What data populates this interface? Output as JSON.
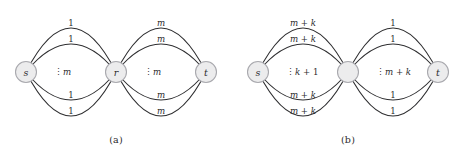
{
  "figure": {
    "kind": "multigraph-diagram",
    "panels": [
      {
        "id": "a",
        "caption": "(a)",
        "nodes": [
          {
            "id": "s",
            "label": "s",
            "cx": 26,
            "cy": 72,
            "r": 10.5
          },
          {
            "id": "r",
            "label": "r",
            "cx": 116,
            "cy": 72,
            "r": 10.5
          },
          {
            "id": "t",
            "label": "t",
            "cx": 206,
            "cy": 72,
            "r": 10.5
          }
        ],
        "bundles": [
          {
            "id": "s-r",
            "from": "s",
            "to": "r",
            "multiplicity_label": "m",
            "dots": "⋮",
            "edges": [
              {
                "label": "1",
                "offset": -44
              },
              {
                "label": "1",
                "offset": -28
              },
              {
                "label": "1",
                "offset": 28
              },
              {
                "label": "1",
                "offset": 44
              }
            ]
          },
          {
            "id": "r-t",
            "from": "r",
            "to": "t",
            "multiplicity_label": "m",
            "dots": "⋮",
            "edges": [
              {
                "label": "m",
                "offset": -44
              },
              {
                "label": "m",
                "offset": -28
              },
              {
                "label": "m",
                "offset": 28
              },
              {
                "label": "m",
                "offset": 44
              }
            ]
          }
        ]
      },
      {
        "id": "b",
        "caption": "(b)",
        "nodes": [
          {
            "id": "s",
            "label": "s",
            "cx": 26,
            "cy": 72,
            "r": 10.5
          },
          {
            "id": "mid",
            "label": "",
            "cx": 116,
            "cy": 72,
            "r": 10.5
          },
          {
            "id": "t",
            "label": "t",
            "cx": 206,
            "cy": 72,
            "r": 10.5
          }
        ],
        "bundles": [
          {
            "id": "s-mid",
            "from": "s",
            "to": "mid",
            "multiplicity_label": "k + 1",
            "dots": "⋮",
            "edges": [
              {
                "label": "m + k",
                "offset": -44
              },
              {
                "label": "m + k",
                "offset": -28
              },
              {
                "label": "m + k",
                "offset": 28
              },
              {
                "label": "m + k",
                "offset": 44
              }
            ]
          },
          {
            "id": "mid-t",
            "from": "mid",
            "to": "t",
            "multiplicity_label": "m + k",
            "dots": "⋮",
            "edges": [
              {
                "label": "1",
                "offset": -44
              },
              {
                "label": "1",
                "offset": -28
              },
              {
                "label": "1",
                "offset": 28
              },
              {
                "label": "1",
                "offset": 44
              }
            ]
          }
        ]
      }
    ],
    "colors": {
      "edge": "#2e2e30",
      "node_fill": "#ececed",
      "node_stroke": "#a9a9ae",
      "text": "#2b2b2d",
      "background": "#ffffff"
    }
  }
}
